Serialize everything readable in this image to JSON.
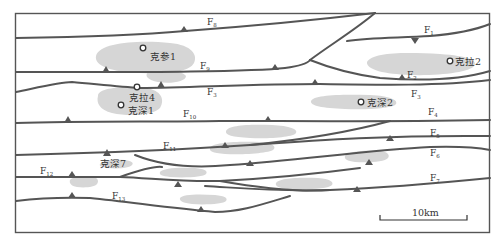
{
  "map": {
    "title": "",
    "scale_bar": {
      "label": "10km"
    },
    "faults": [
      {
        "id": "F1",
        "name": "F",
        "sub": "1"
      },
      {
        "id": "F2",
        "name": "F",
        "sub": "2"
      },
      {
        "id": "F3",
        "name": "F",
        "sub": "3"
      },
      {
        "id": "F3b",
        "name": "F",
        "sub": "3"
      },
      {
        "id": "F4",
        "name": "F",
        "sub": "4"
      },
      {
        "id": "F5",
        "name": "F",
        "sub": "5"
      },
      {
        "id": "F6",
        "name": "F",
        "sub": "6"
      },
      {
        "id": "F7",
        "name": "F",
        "sub": "7"
      },
      {
        "id": "F8",
        "name": "F",
        "sub": "8"
      },
      {
        "id": "F9",
        "name": "F",
        "sub": "9"
      },
      {
        "id": "F10",
        "name": "F",
        "sub": "10"
      },
      {
        "id": "F11",
        "name": "F",
        "sub": "11"
      },
      {
        "id": "F12",
        "name": "F",
        "sub": "12"
      },
      {
        "id": "F13",
        "name": "F",
        "sub": "13"
      }
    ],
    "wells": [
      {
        "name": "克参1"
      },
      {
        "name": "克拉4"
      },
      {
        "name": "克深1"
      },
      {
        "name": "克拉2"
      },
      {
        "name": "克深2"
      },
      {
        "name": "克深7"
      }
    ],
    "colors": {
      "fault_line": "#555555",
      "structure_zone": "#d6d6d6",
      "frame": "#555555",
      "text": "#333333"
    }
  }
}
